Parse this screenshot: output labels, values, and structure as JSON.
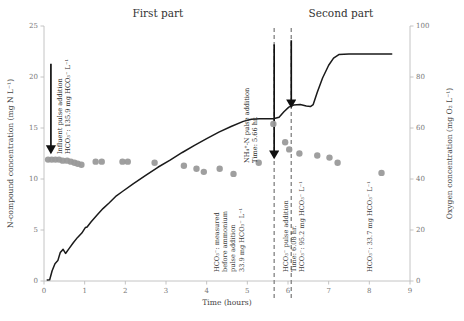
{
  "chart_data": {
    "type": "scatter",
    "title": "",
    "xlabel": "Time (hours)",
    "ylabel": "N-compound concentration (mg N L⁻¹)",
    "y2label": "Oxygen concentration (mg O₂ L⁻¹)",
    "xlim": [
      0,
      9
    ],
    "ylim": [
      0,
      25
    ],
    "y2lim": [
      0,
      100
    ],
    "xticks": [
      "0",
      "1",
      "2",
      "3",
      "4",
      "5",
      "6",
      "7",
      "8",
      "9"
    ],
    "yticks": [
      "0",
      "5",
      "10",
      "15",
      "20",
      "25"
    ],
    "y2ticks": [
      "0",
      "20",
      "40",
      "60",
      "80",
      "100"
    ],
    "grid": false,
    "legend": "none",
    "series": [
      {
        "name": "N-compound concentration",
        "type": "scatter",
        "marker": "circle",
        "color": "#9a9a9a",
        "points": [
          [
            0.1,
            11.9
          ],
          [
            0.19,
            11.9
          ],
          [
            0.28,
            11.9
          ],
          [
            0.37,
            11.9
          ],
          [
            0.46,
            11.8
          ],
          [
            0.57,
            11.8
          ],
          [
            0.66,
            11.7
          ],
          [
            0.75,
            11.6
          ],
          [
            0.83,
            11.5
          ],
          [
            0.92,
            11.4
          ],
          [
            1.27,
            11.7
          ],
          [
            1.42,
            11.7
          ],
          [
            1.93,
            11.7
          ],
          [
            2.06,
            11.7
          ],
          [
            2.72,
            11.6
          ],
          [
            3.44,
            11.3
          ],
          [
            3.75,
            11.0
          ],
          [
            3.93,
            10.7
          ],
          [
            4.32,
            11.0
          ],
          [
            4.66,
            10.5
          ],
          [
            5.28,
            11.6
          ],
          [
            5.64,
            15.4
          ],
          [
            5.93,
            13.6
          ],
          [
            6.03,
            12.9
          ],
          [
            6.28,
            12.5
          ],
          [
            6.72,
            12.3
          ],
          [
            7.02,
            12.1
          ],
          [
            7.22,
            11.6
          ],
          [
            8.3,
            10.6
          ]
        ]
      },
      {
        "name": "Oxygen concentration",
        "type": "line",
        "color": "#1a1a1a",
        "axis": "right",
        "points": [
          [
            0.08,
            0.4
          ],
          [
            0.14,
            0.5
          ],
          [
            0.2,
            4.0
          ],
          [
            0.27,
            6.8
          ],
          [
            0.34,
            8.0
          ],
          [
            0.4,
            11.2
          ],
          [
            0.47,
            12.4
          ],
          [
            0.53,
            10.8
          ],
          [
            0.62,
            12.8
          ],
          [
            0.72,
            15.0
          ],
          [
            0.82,
            17.0
          ],
          [
            0.93,
            18.8
          ],
          [
            1.02,
            21.0
          ],
          [
            1.06,
            21.2
          ],
          [
            1.16,
            23.2
          ],
          [
            1.3,
            25.8
          ],
          [
            1.45,
            28.4
          ],
          [
            1.6,
            30.6
          ],
          [
            1.78,
            33.4
          ],
          [
            1.92,
            35.0
          ],
          [
            2.2,
            38.2
          ],
          [
            2.5,
            41.4
          ],
          [
            2.8,
            44.6
          ],
          [
            3.1,
            47.4
          ],
          [
            3.4,
            50.4
          ],
          [
            3.7,
            53.2
          ],
          [
            4.0,
            55.8
          ],
          [
            4.3,
            58.4
          ],
          [
            4.6,
            60.6
          ],
          [
            4.9,
            62.6
          ],
          [
            5.1,
            63.4
          ],
          [
            5.3,
            63.6
          ],
          [
            5.64,
            63.6
          ],
          [
            5.78,
            64.2
          ],
          [
            5.9,
            66.4
          ],
          [
            6.02,
            68.2
          ],
          [
            6.14,
            69.0
          ],
          [
            6.3,
            69.2
          ],
          [
            6.45,
            68.6
          ],
          [
            6.55,
            68.4
          ],
          [
            6.62,
            69.2
          ],
          [
            6.72,
            74.0
          ],
          [
            6.85,
            79.6
          ],
          [
            7.0,
            84.6
          ],
          [
            7.12,
            87.4
          ],
          [
            7.25,
            88.8
          ],
          [
            7.5,
            89.0
          ],
          [
            8.0,
            89.0
          ],
          [
            8.55,
            89.0
          ]
        ]
      }
    ],
    "vlines": [
      {
        "name": "ammonium-pulse-line",
        "x": 5.66,
        "style": "dashed"
      },
      {
        "name": "bicarbonate-pulse-line",
        "x": 6.08,
        "style": "dashed"
      }
    ],
    "arrows": [
      {
        "name": "influent-pulse-arrow",
        "x": 0.17,
        "y_from": 21.3,
        "y_to": 12.9
      },
      {
        "name": "ammonium-pulse-arrow",
        "x": 5.66,
        "y_from": 23.2,
        "y_to": 12.4
      },
      {
        "name": "bicarbonate-pulse-arrow",
        "x": 6.08,
        "y_from": 23.6,
        "y_to": 17.4
      }
    ],
    "section_labels": [
      {
        "name": "first-part-title",
        "text": "First part",
        "x": 2.8
      },
      {
        "name": "second-part-title",
        "text": "Second part",
        "x": 7.3
      }
    ],
    "annotations": [
      {
        "name": "influent-pulse-annotation",
        "lines": [
          "Influent pulse addition",
          "HCO₃⁻: 135.9 mg HCO₃⁻ L⁻¹"
        ],
        "orientation": "vertical"
      },
      {
        "name": "ammonium-pulse-annotation",
        "lines": [
          "NH₄⁺-N pulse addition",
          "Time: 5.66 hr."
        ],
        "orientation": "vertical"
      },
      {
        "name": "bicarbonate-measured-annotation",
        "lines": [
          "HCO₃⁻: measured",
          "before ammonium",
          "pulse addition",
          "33.9 mg HCO₃⁻ L⁻¹"
        ],
        "orientation": "vertical"
      },
      {
        "name": "bicarbonate-pulse-annotation",
        "lines": [
          "HCO₃⁻ pulse addition",
          "Time: 6.08 hr.",
          "HCO₃⁻: 95.2 mg HCO₃⁻ L⁻¹"
        ],
        "orientation": "vertical"
      },
      {
        "name": "bicarbonate-final-annotation",
        "lines": [
          "HCO₃⁻: 33.7 mg HCO₃⁻ L⁻¹"
        ],
        "orientation": "vertical"
      }
    ],
    "colors": {
      "marker": "#9a9a9a",
      "line": "#1a1a1a",
      "axis": "#bdbdbd",
      "dashed": "#8a8a8a"
    }
  }
}
